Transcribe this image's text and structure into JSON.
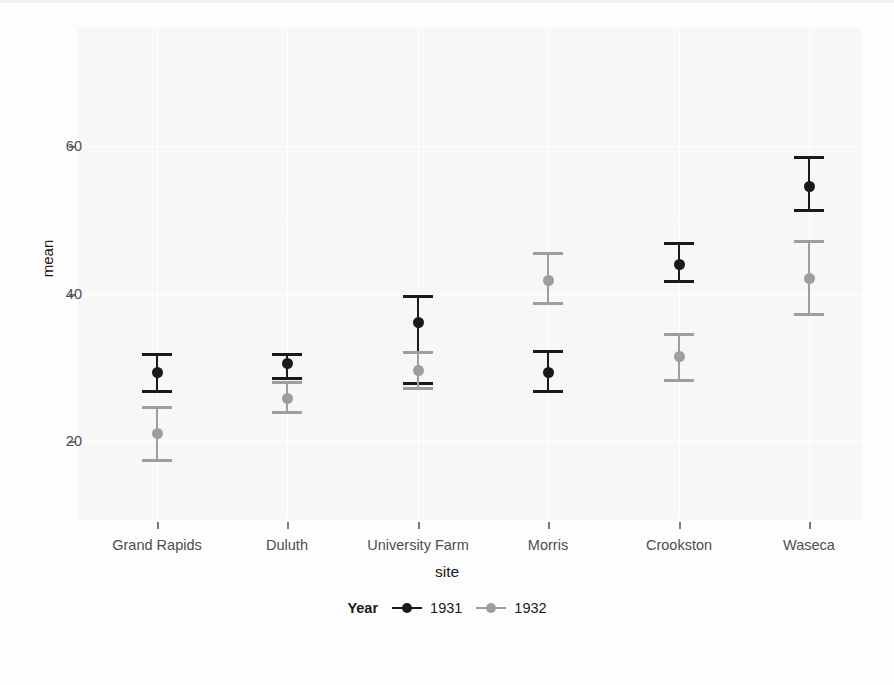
{
  "chart_data": {
    "type": "scatter",
    "title": "",
    "subtitle": "",
    "xlabel": "site",
    "ylabel": "mean",
    "categories": [
      "Grand Rapids",
      "Duluth",
      "University Farm",
      "Morris",
      "Crookston",
      "Waseca"
    ],
    "ylim": [
      10,
      65
    ],
    "yticks": [
      20,
      40,
      60
    ],
    "ytick_labels": [
      "20",
      "40",
      "60"
    ],
    "grid": true,
    "grid_major_y": [
      20,
      40,
      60
    ],
    "grid_minor_y": [
      10,
      30,
      50,
      60
    ],
    "legend": {
      "title": "Year",
      "position": "bottom",
      "entries": [
        {
          "label": "1931",
          "color": "#1a1a1a"
        },
        {
          "label": "1932",
          "color": "#9e9e9e"
        }
      ]
    },
    "series": [
      {
        "name": "1931",
        "color": "#1a1a1a",
        "values": [
          29.3,
          30.5,
          36.1,
          29.3,
          43.9,
          54.5
        ],
        "errors_low": [
          26.5,
          28.3,
          27.6,
          26.5,
          41.4,
          51.0
        ],
        "errors_high": [
          32.0,
          32.0,
          39.8,
          32.3,
          47.0,
          58.6
        ]
      },
      {
        "name": "1932",
        "color": "#9e9e9e",
        "values": [
          21.0,
          25.7,
          29.5,
          41.8,
          31.4,
          42.0
        ],
        "errors_low": [
          17.1,
          23.6,
          26.9,
          38.4,
          28.0,
          37.0
        ],
        "errors_high": [
          24.7,
          28.1,
          32.2,
          45.6,
          34.7,
          47.3
        ]
      }
    ]
  },
  "axes": {
    "y_title": "mean",
    "x_title": "site",
    "y_tick_labels": [
      "60",
      "40",
      "20"
    ],
    "x_tick_labels": [
      "Grand Rapids",
      "Duluth",
      "University Farm",
      "Morris",
      "Crookston",
      "Waseca"
    ]
  },
  "legend": {
    "title": "Year",
    "items": [
      {
        "label": "1931",
        "color": "#1a1a1a"
      },
      {
        "label": "1932",
        "color": "#9e9e9e"
      }
    ]
  },
  "colors": {
    "panel_background": "#f7f7f7",
    "figure_background": "#fdfdfd",
    "gridline": "#ffffff",
    "series_1931": "#1a1a1a",
    "series_1932": "#9e9e9e",
    "axis_text": "#4d4d4d",
    "title_text": "#1a1a1a"
  }
}
